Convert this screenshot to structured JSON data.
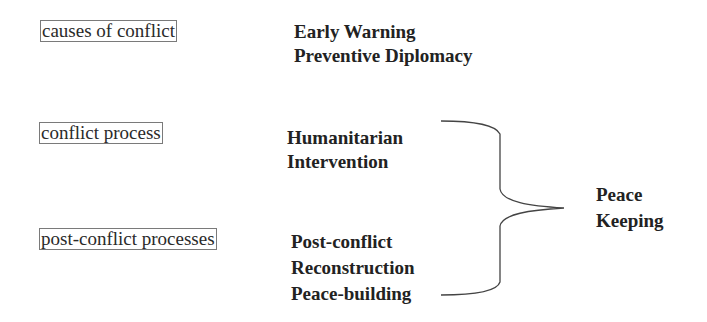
{
  "stages": [
    {
      "label": "causes of conflict"
    },
    {
      "label": "conflict process"
    },
    {
      "label": "post-conflict processes"
    }
  ],
  "responses": [
    {
      "lines": [
        "Early Warning",
        "Preventive Diplomacy"
      ]
    },
    {
      "lines": [
        "Humanitarian",
        "Intervention"
      ]
    },
    {
      "lines": [
        "Post-conflict",
        "Reconstruction",
        "Peace-building"
      ]
    }
  ],
  "grouped_outcome": {
    "lines": [
      "Peace",
      "Keeping"
    ]
  },
  "colors": {
    "box_border": "#7a7a7a",
    "text": "#222222",
    "brace": "#444444"
  }
}
